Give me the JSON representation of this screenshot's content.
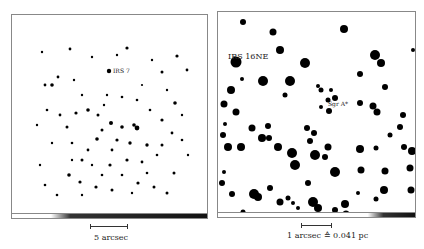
{
  "figure": {
    "left_panel": {
      "annotation": "IRS 7",
      "scale_bar_label": "5 arcsec"
    },
    "right_panel": {
      "corner_label": "IRS 16NE",
      "annotation": "Sgr A*",
      "scale_bar_label": "1 arcsec ≙ 0.041 pc"
    }
  }
}
